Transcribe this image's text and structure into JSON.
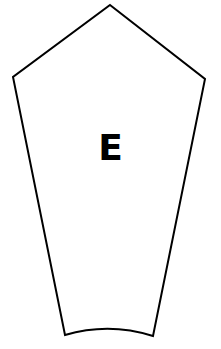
{
  "shape": {
    "label": "E",
    "stroke_color": "#000000",
    "fill_color": "#ffffff",
    "vertices": {
      "apex": [
        110,
        5
      ],
      "left": [
        13,
        77
      ],
      "right": [
        205,
        79
      ],
      "bottom_left": [
        65,
        335
      ],
      "bottom_right": [
        153,
        336
      ]
    },
    "bottom_edge": "curved"
  }
}
